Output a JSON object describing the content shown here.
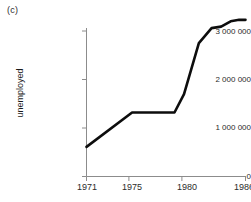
{
  "panel": {
    "label": "(c)"
  },
  "chart_data": {
    "type": "line",
    "title": "",
    "subtitle": "",
    "xlabel": "",
    "ylabel": "unemployed",
    "xlim": [
      1971,
      1986
    ],
    "ylim": [
      0,
      3500000
    ],
    "grid": false,
    "legend": false,
    "legend_position": "none",
    "x_tick_labels": [
      "1971",
      "1975",
      "1980",
      "1986"
    ],
    "x_ticks": [
      1971,
      1975,
      1980,
      1986
    ],
    "y_tick_labels": [
      "0",
      "1 000 000",
      "2 000 000",
      "3 000 000"
    ],
    "y_ticks": [
      0,
      1000000,
      2000000,
      3000000
    ],
    "line_color": "#0d0d0d",
    "axis_color": "#8c8c8c",
    "series": [
      {
        "name": "unemployed",
        "x": [
          1971,
          1975.3,
          1979.3,
          1980.2,
          1981.6,
          1982.8,
          1983.7,
          1984.6,
          1985.4,
          1986
        ],
        "values": [
          610000,
          1320000,
          1320000,
          1700000,
          2750000,
          3060000,
          3090000,
          3200000,
          3230000,
          3230000
        ]
      }
    ]
  }
}
